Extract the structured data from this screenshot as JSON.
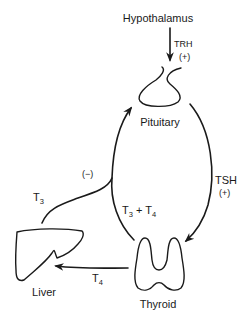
{
  "diagram": {
    "type": "hormone-feedback-loop",
    "nodes": {
      "hypothalamus": {
        "label": "Hypothalamus"
      },
      "pituitary": {
        "label": "Pituitary"
      },
      "thyroid": {
        "label": "Thyroid"
      },
      "liver": {
        "label": "Liver"
      }
    },
    "edges": {
      "trh": {
        "hormone": "TRH",
        "effect": "(+)",
        "from": "Hypothalamus",
        "to": "Pituitary"
      },
      "tsh": {
        "hormone": "TSH",
        "effect": "(+)",
        "from": "Pituitary",
        "to": "Thyroid"
      },
      "feedback": {
        "hormone_main": "T",
        "hormone_sub_1": "3",
        "plus": " + ",
        "hormone_main_2": "T",
        "hormone_sub_2": "4",
        "effect": "(−)",
        "from": "Thyroid",
        "to": "Pituitary"
      },
      "liver_t3": {
        "hormone_main": "T",
        "hormone_sub": "3",
        "from": "Liver",
        "to": "Pituitary"
      },
      "t4_to_liver": {
        "hormone_main": "T",
        "hormone_sub": "4",
        "from": "Thyroid",
        "to": "Liver"
      }
    }
  }
}
